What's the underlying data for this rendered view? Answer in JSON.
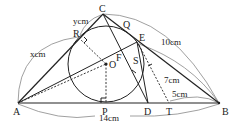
{
  "diagram": {
    "points": {
      "A": "A",
      "B": "B",
      "C": "C",
      "O": "O",
      "P": "P",
      "D": "D",
      "T": "T",
      "E": "E",
      "Q": "Q",
      "R": "R",
      "F": "F",
      "S": "S"
    },
    "measurements": {
      "AB": "14cm",
      "BC": "10cm",
      "AR": "xcm",
      "CR": "ycm",
      "BE": "7cm",
      "BT": "5cm"
    }
  }
}
